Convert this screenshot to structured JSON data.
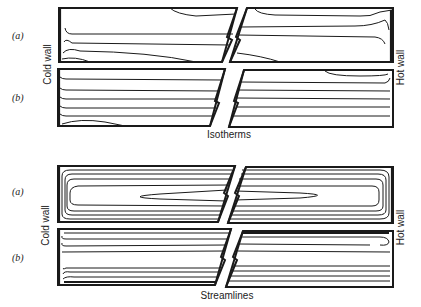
{
  "figure": {
    "groups": [
      {
        "caption": "Isotherms",
        "panels": [
          {
            "label": "(a)"
          },
          {
            "label": "(b)"
          }
        ],
        "left_wall": "Cold wall",
        "right_wall": "Hot wall"
      },
      {
        "caption": "Streamlines",
        "panels": [
          {
            "label": "(a)"
          },
          {
            "label": "(b)"
          }
        ],
        "left_wall": "Cold wall",
        "right_wall": "Hot wall"
      }
    ],
    "colors": {
      "ink": "#1a1a1a",
      "background": "#ffffff"
    }
  }
}
